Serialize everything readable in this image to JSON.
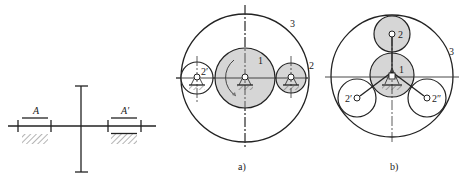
{
  "figure_left": {
    "labels": {
      "left_bearing": "A",
      "right_bearing": "A′"
    }
  },
  "figure_a": {
    "caption": "a)",
    "labels": {
      "sun": "1",
      "planet_right": "2",
      "planet_left": "2′",
      "ring": "3"
    }
  },
  "figure_b": {
    "caption": "b)",
    "labels": {
      "sun": "1",
      "planet_top": "2",
      "planet_left": "2′",
      "planet_right": "2″",
      "ring": "3"
    }
  },
  "colors": {
    "line": "#222222",
    "gear_fill": "#d6d6d6",
    "background": "#ffffff"
  }
}
